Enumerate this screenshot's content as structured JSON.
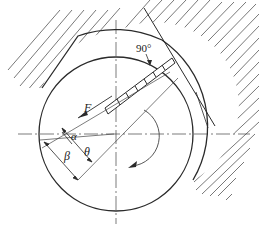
{
  "diagram": {
    "type": "vane-pump-blade-force-schematic",
    "labels": {
      "force": "F",
      "alpha": "α",
      "beta": "β",
      "theta": "θ",
      "right_angle": "90°"
    },
    "elements": [
      "rotor-circle",
      "stator-arc",
      "hatched-housing",
      "vane-blade-slot",
      "tangent-line",
      "horizontal-centerline",
      "vertical-centerline",
      "rotation-arrow",
      "force-arrow"
    ],
    "colors": {
      "line": "#2a2a2a",
      "hatch": "#555555",
      "background": "#ffffff"
    }
  }
}
